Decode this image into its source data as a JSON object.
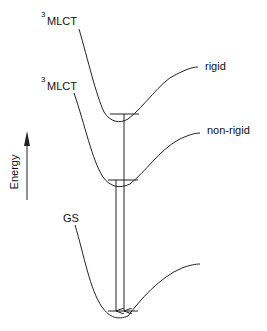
{
  "diagram": {
    "type": "potential-energy-surface",
    "states": [
      {
        "id": "mlct-rigid",
        "label_sup": "3",
        "label": "MLCT",
        "tag": "rigid"
      },
      {
        "id": "mlct-nonrigid",
        "label_sup": "3",
        "label": "MLCT",
        "tag": "non-rigid"
      },
      {
        "id": "gs",
        "label": "GS"
      }
    ],
    "axis": {
      "label": "Energy"
    },
    "transitions": [
      {
        "from": "mlct-rigid",
        "to": "gs"
      },
      {
        "from": "mlct-nonrigid",
        "to": "gs"
      }
    ]
  }
}
